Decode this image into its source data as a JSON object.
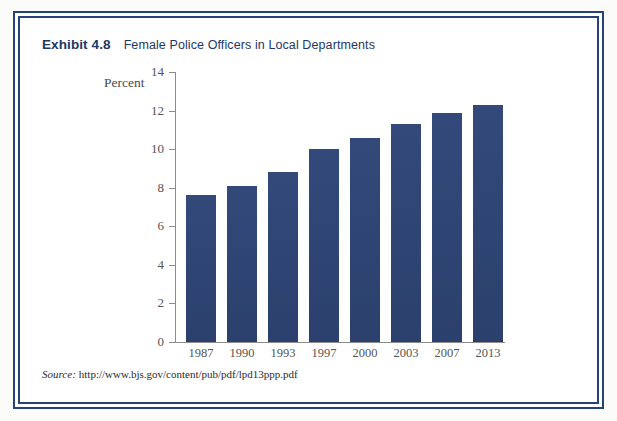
{
  "figure": {
    "exhibit_label": "Exhibit 4.8",
    "title": "Female Police Officers in Local Departments",
    "source_label": "Source:",
    "source_url": "http://www.bjs.gov/content/pub/pdf/lpd13ppp.pdf",
    "frame_color": "#26427a",
    "bar_color": "#2e4573",
    "title_color": "#1d3768"
  },
  "chart_data": {
    "type": "bar",
    "title": "Female Police Officers in Local Departments",
    "xlabel": "",
    "ylabel": "Percent",
    "categories": [
      "1987",
      "1990",
      "1993",
      "1997",
      "2000",
      "2003",
      "2007",
      "2013"
    ],
    "values": [
      7.6,
      8.1,
      8.8,
      10.0,
      10.6,
      11.3,
      11.9,
      12.3
    ],
    "ylim": [
      0,
      14
    ],
    "yticks": [
      0,
      2,
      4,
      6,
      8,
      10,
      12,
      14
    ],
    "ytick_labels": [
      "0",
      "2",
      "4",
      "6",
      "8",
      "10",
      "12",
      "14"
    ],
    "grid": false,
    "legend": "none",
    "series": [
      {
        "name": "Percent female police officers",
        "values": [
          7.6,
          8.1,
          8.8,
          10.0,
          10.6,
          11.3,
          11.9,
          12.3
        ]
      }
    ]
  }
}
